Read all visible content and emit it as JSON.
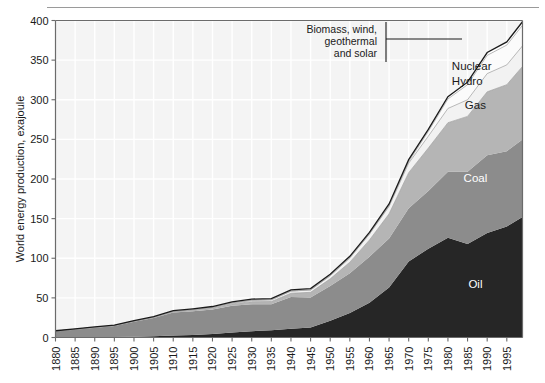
{
  "chart_data": {
    "type": "area",
    "stacked": true,
    "title": "",
    "xlabel": "",
    "ylabel": "World energy production, exajoule",
    "xlim": [
      1880,
      1999
    ],
    "ylim": [
      0,
      400
    ],
    "yticks": [
      0,
      50,
      100,
      150,
      200,
      250,
      300,
      350,
      400
    ],
    "xticks": [
      1880,
      1885,
      1890,
      1895,
      1900,
      1905,
      1910,
      1915,
      1920,
      1925,
      1930,
      1935,
      1940,
      1945,
      1950,
      1955,
      1960,
      1965,
      1970,
      1975,
      1980,
      1985,
      1990,
      1995
    ],
    "grid": true,
    "legend_position": "inline-labels",
    "x": [
      1880,
      1885,
      1890,
      1895,
      1900,
      1905,
      1910,
      1915,
      1920,
      1925,
      1930,
      1935,
      1940,
      1945,
      1950,
      1955,
      1960,
      1965,
      1970,
      1975,
      1980,
      1985,
      1990,
      1995,
      1999
    ],
    "series": [
      {
        "name": "Oil",
        "color": "#262626",
        "values": [
          0.1,
          0.2,
          0.4,
          0.6,
          1.0,
          1.6,
          2.4,
          3.2,
          4.4,
          6.2,
          8.0,
          9.0,
          11.0,
          12.5,
          21.0,
          31.0,
          44.0,
          63.0,
          96.0,
          112.0,
          126.0,
          118.0,
          132.0,
          140.0,
          152.0
        ]
      },
      {
        "name": "Coal",
        "color": "#8c8c8c",
        "values": [
          8.0,
          10.0,
          12.0,
          14.0,
          19.0,
          23.0,
          29.0,
          30.0,
          31.0,
          34.0,
          34.0,
          33.0,
          40.0,
          38.0,
          44.0,
          50.0,
          58.0,
          62.0,
          67.0,
          73.0,
          83.0,
          91.0,
          98.0,
          95.0,
          98.0
        ]
      },
      {
        "name": "Gas",
        "color": "#b5b5b5",
        "values": [
          0.0,
          0.1,
          0.2,
          0.3,
          0.4,
          0.6,
          0.9,
          1.2,
          1.6,
          2.2,
          3.2,
          3.4,
          4.8,
          6.5,
          9.0,
          14.0,
          21.0,
          31.0,
          45.0,
          54.0,
          62.0,
          70.0,
          80.0,
          84.0,
          92.0
        ]
      },
      {
        "name": "Hydro",
        "color": "#f2f2f2",
        "values": [
          0.0,
          0.0,
          0.1,
          0.1,
          0.2,
          0.3,
          0.5,
          0.7,
          0.9,
          1.3,
          1.8,
          2.2,
          2.8,
          3.0,
          4.0,
          5.5,
          7.5,
          9.5,
          12.0,
          15.0,
          18.0,
          21.0,
          23.0,
          25.0,
          26.0
        ]
      },
      {
        "name": "Nuclear",
        "color": "#fbfbfb",
        "values": [
          0.0,
          0.0,
          0.0,
          0.0,
          0.0,
          0.0,
          0.0,
          0.0,
          0.0,
          0.0,
          0.0,
          0.0,
          0.0,
          0.0,
          0.0,
          0.0,
          0.2,
          0.8,
          2.0,
          6.0,
          12.0,
          19.0,
          23.0,
          25.0,
          26.0
        ]
      },
      {
        "name": "Biomass, wind, geothermal and solar",
        "color": "#ffffff",
        "values": [
          0.4,
          0.5,
          0.6,
          0.7,
          0.8,
          0.9,
          1.0,
          1.1,
          1.2,
          1.3,
          1.4,
          1.5,
          1.6,
          1.7,
          1.8,
          1.9,
          2.0,
          2.2,
          2.4,
          2.6,
          2.9,
          3.2,
          3.6,
          4.0,
          4.4
        ]
      }
    ],
    "totals_note": "Total world energy production rises from about 9 exajoule in 1880 to about 398 exajoule in 1999",
    "band_labels": [
      {
        "name": "Oil",
        "x": 1987,
        "y": 62
      },
      {
        "name": "Coal",
        "x": 1987,
        "y": 196
      },
      {
        "name": "Gas",
        "x": 1987,
        "y": 288
      },
      {
        "name": "Nuclear",
        "x": 1982,
        "y": 337
      },
      {
        "name": "Hydro",
        "x": 1982,
        "y": 318
      }
    ],
    "annotations": [
      {
        "text_lines": [
          "Biomass, wind,",
          "geothermal",
          "and solar"
        ],
        "points_to_series": "Biomass, wind, geothermal and solar",
        "leader_x": 1978,
        "leader_y": 378
      }
    ]
  },
  "axis": {
    "y_title": "World energy production, exajoule",
    "y_ticks": [
      "0",
      "50",
      "100",
      "150",
      "200",
      "250",
      "300",
      "350",
      "400"
    ],
    "x_ticks": [
      "1880",
      "1885",
      "1890",
      "1895",
      "1900",
      "1905",
      "1910",
      "1915",
      "1920",
      "1925",
      "1930",
      "1935",
      "1940",
      "1945",
      "1950",
      "1955",
      "1960",
      "1965",
      "1970",
      "1975",
      "1980",
      "1985",
      "1990",
      "1995"
    ]
  },
  "labels": {
    "oil": "Oil",
    "coal": "Coal",
    "gas": "Gas",
    "nuclear": "Nuclear",
    "hydro": "Hydro",
    "annot_line1": "Biomass, wind,",
    "annot_line2": "geothermal",
    "annot_line3": "and solar"
  },
  "colors": {
    "oil": "#262626",
    "coal": "#8c8c8c",
    "gas": "#b5b5b5",
    "hydro": "#f2f2f2",
    "nuclear": "#fbfbfb",
    "biomass": "#ffffff",
    "plot_bg": "#f4f4f4",
    "gridline": "#ffffff",
    "axis": "#6b6b6b",
    "text": "#1a1a1a"
  }
}
